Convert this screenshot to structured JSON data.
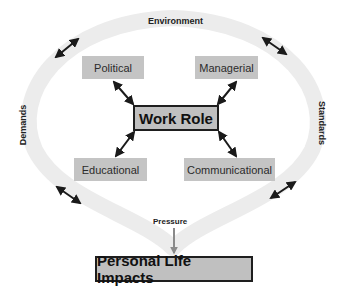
{
  "diagram": {
    "ring": {
      "top_label": "Environment",
      "left_label": "Demands",
      "right_label": "Standards",
      "ring_color": "#ebebeb"
    },
    "center": {
      "label": "Work Role"
    },
    "nodes": [
      {
        "id": "political",
        "label": "Political"
      },
      {
        "id": "managerial",
        "label": "Managerial"
      },
      {
        "id": "educational",
        "label": "Educational"
      },
      {
        "id": "communicational",
        "label": "Communicational"
      }
    ],
    "pressure": {
      "label": "Pressure",
      "arrow_color": "#8a8a8a"
    },
    "bottom": {
      "label": "Personal Life Impacts"
    },
    "colors": {
      "box_fill": "#c4c4c4",
      "arrow": "#1a1a1a",
      "border": "#1e1e1e"
    }
  }
}
